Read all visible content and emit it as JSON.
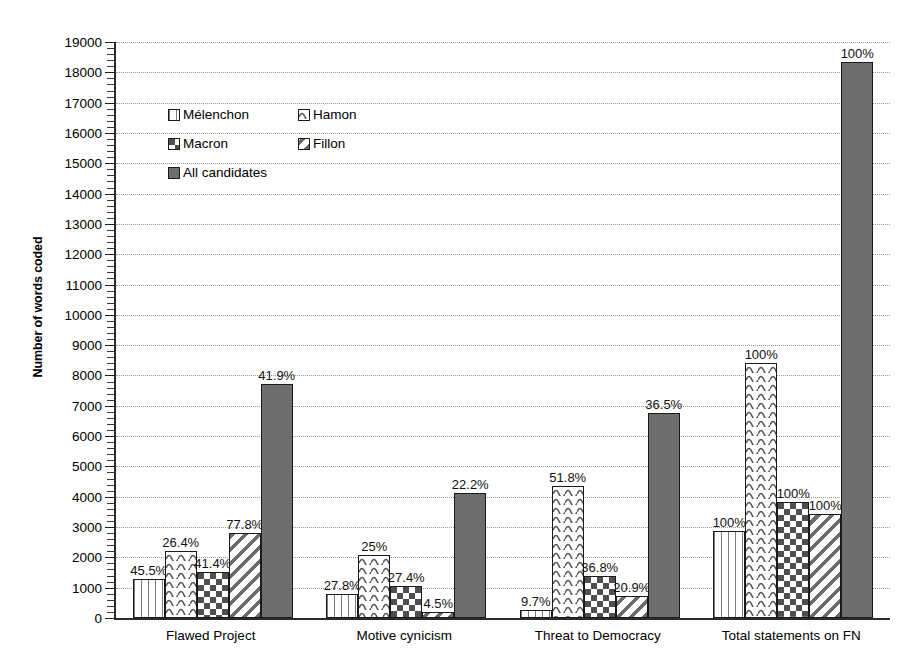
{
  "chart_data": {
    "type": "bar",
    "title": "",
    "xlabel": "",
    "ylabel": "Number of words coded",
    "ylim": [
      0,
      19000
    ],
    "ytick_step": 1000,
    "yticks": [
      0,
      1000,
      2000,
      3000,
      4000,
      5000,
      6000,
      7000,
      8000,
      9000,
      10000,
      11000,
      12000,
      13000,
      14000,
      15000,
      16000,
      17000,
      18000,
      19000
    ],
    "grid": true,
    "legend_position": "upper-left-inside",
    "categories": [
      "Flawed Project",
      "Motive cynicism",
      "Threat to Democracy",
      "Total statements on FN"
    ],
    "series": [
      {
        "name": "Mélenchon",
        "pattern": "vertical-lines",
        "values": [
          1300,
          800,
          280,
          2880
        ],
        "data_labels": [
          "45.5%",
          "27.8%",
          "9.7%",
          "100%"
        ]
      },
      {
        "name": "Hamon",
        "pattern": "wavy-lines",
        "values": [
          2200,
          2080,
          4350,
          8420
        ],
        "data_labels": [
          "26.4%",
          "25%",
          "51.8%",
          "100%"
        ]
      },
      {
        "name": "Macron",
        "pattern": "checkerboard",
        "values": [
          1520,
          1060,
          1400,
          3820
        ],
        "data_labels": [
          "41.4%",
          "27.4%",
          "36.8%",
          "100%"
        ]
      },
      {
        "name": "Fillon",
        "pattern": "diagonal-stripes",
        "values": [
          2800,
          200,
          710,
          3430
        ],
        "data_labels": [
          "77.8%",
          "4.5%",
          "20.9%",
          "100%"
        ]
      },
      {
        "name": "All candidates",
        "pattern": "solid-gray",
        "values": [
          7720,
          4110,
          6760,
          18350
        ],
        "data_labels": [
          "41.9%",
          "22.2%",
          "36.5%",
          "100%"
        ]
      }
    ]
  },
  "axis": {
    "y_title": "Number of words coded"
  },
  "legend": {
    "rows": [
      [
        {
          "label": "Mélenchon",
          "pattern": "vertical-lines"
        },
        {
          "label": "Hamon",
          "pattern": "wavy-lines"
        }
      ],
      [
        {
          "label": "Macron",
          "pattern": "checkerboard"
        },
        {
          "label": "Fillon",
          "pattern": "diagonal-stripes"
        }
      ],
      [
        {
          "label": "All candidates",
          "pattern": "solid-gray"
        }
      ]
    ]
  },
  "colors": {
    "series_fill": "#6e6e6e",
    "outline": "#1a1a1a",
    "gridline": "#9a9a9a",
    "background": "#ffffff"
  }
}
